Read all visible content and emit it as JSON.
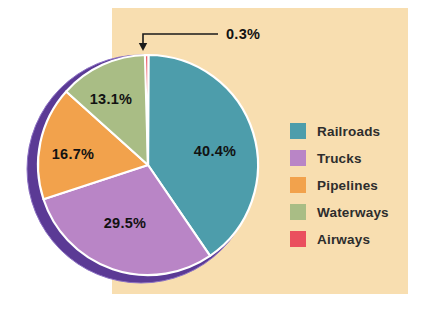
{
  "figure": {
    "background_color": "#ffffff",
    "panel_color": "#f8deb0"
  },
  "chart_data": {
    "type": "pie",
    "title": "",
    "slices": [
      {
        "name": "Railroads",
        "value": 40.4,
        "label": "40.4%",
        "color": "#4d9dab"
      },
      {
        "name": "Trucks",
        "value": 29.5,
        "label": "29.5%",
        "color": "#b985c6"
      },
      {
        "name": "Pipelines",
        "value": 16.7,
        "label": "16.7%",
        "color": "#f2a24c"
      },
      {
        "name": "Waterways",
        "value": 13.1,
        "label": "13.1%",
        "color": "#a9bd85"
      },
      {
        "name": "Airways",
        "value": 0.3,
        "label": "0.3%",
        "color": "#ea4f5e"
      }
    ],
    "clockwise_order": [
      "Airways",
      "Railroads",
      "Trucks",
      "Pipelines",
      "Waterways"
    ],
    "start_angle_deg": -1.6,
    "legend_position": "right",
    "separator_color": "#ffffff",
    "shadow_color": "#5b3a95",
    "shadow_edge_color": "#8d72c4",
    "callout": {
      "slice": "Airways",
      "text": "0.3%"
    }
  }
}
